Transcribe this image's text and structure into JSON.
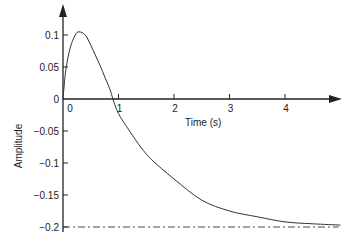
{
  "chart_data": {
    "type": "line",
    "title": "",
    "xlabel": "Time (s)",
    "ylabel": "Amplitude",
    "xlim": [
      0,
      5
    ],
    "ylim": [
      -0.2,
      0.12
    ],
    "grid": false,
    "legend": null,
    "x_ticks": [
      "0",
      "1",
      "2",
      "3",
      "4"
    ],
    "y_ticks": [
      "0.1",
      "0.05",
      "0",
      "-0.05",
      "-0.1",
      "-0.15",
      "-0.2"
    ],
    "series": [
      {
        "name": "response",
        "style": "solid",
        "x": [
          0,
          0.05,
          0.13,
          0.22,
          0.29,
          0.4,
          0.49,
          0.58,
          0.67,
          0.76,
          0.85,
          0.9,
          1.0,
          1.2,
          1.4,
          1.6,
          2.0,
          2.5,
          3.0,
          3.5,
          4.0,
          4.5,
          5.0
        ],
        "y": [
          0,
          0.045,
          0.08,
          0.1,
          0.105,
          0.1,
          0.086,
          0.069,
          0.052,
          0.033,
          0.014,
          0,
          -0.023,
          -0.05,
          -0.075,
          -0.095,
          -0.125,
          -0.158,
          -0.175,
          -0.184,
          -0.192,
          -0.195,
          -0.197
        ]
      },
      {
        "name": "asymptote",
        "style": "dashdot",
        "x": [
          0,
          5
        ],
        "y": [
          -0.2,
          -0.2
        ]
      }
    ]
  },
  "axes": {
    "x_label": "Time (s)",
    "y_label": "Amplitude"
  }
}
